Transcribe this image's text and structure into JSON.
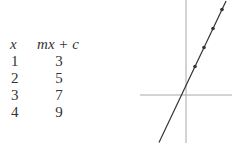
{
  "table": {
    "headers": [
      "x",
      "mx + c"
    ],
    "rows": [
      {
        "x": "1",
        "y": "3"
      },
      {
        "x": "2",
        "y": "5"
      },
      {
        "x": "3",
        "y": "7"
      },
      {
        "x": "4",
        "y": "9"
      }
    ]
  },
  "graph": {
    "line": {
      "m": 2,
      "c": 1
    },
    "points": [
      {
        "x": 1,
        "y": 3
      },
      {
        "x": 2,
        "y": 5
      },
      {
        "x": 3,
        "y": 7
      },
      {
        "x": 4,
        "y": 9
      }
    ],
    "axis_color": "#a8a8a8",
    "line_color": "#333333",
    "point_color": "#333333"
  }
}
